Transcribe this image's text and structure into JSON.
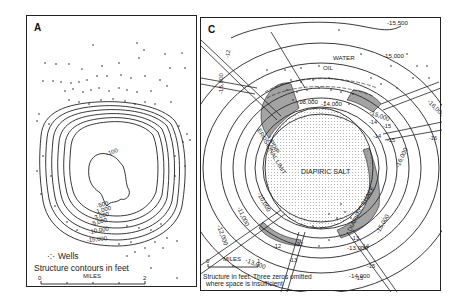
{
  "figure": {
    "panels": [
      {
        "id": "A",
        "letter": "A",
        "title": "Structure contours around salt dome (plan view)",
        "contour_labels": [
          "-100",
          "-500",
          "-1,000",
          "-3,000",
          "-5,000",
          "-10,000",
          "-15,000"
        ],
        "legend": {
          "wells_symbol": "·:·",
          "wells_label": "Wells",
          "contours_label": "Structure contours in feet"
        },
        "scale_bar": {
          "start": "0",
          "unit": "MILES",
          "end": "2"
        }
      },
      {
        "id": "C",
        "letter": "C",
        "contour_labels": {
          "outer": [
            "-15,500",
            "-15,000",
            "-16,000",
            "-16,000",
            "-15,000",
            "-14,000",
            "-13,000",
            "-12,000",
            "-11,000",
            "-10,000",
            "-15,000",
            "-14,000",
            "-13,000"
          ],
          "inner": [
            "-14,000",
            "-13,000"
          ],
          "fault_block": [
            "-14",
            "-15",
            "-14",
            "-15",
            "-16",
            "-12",
            "-12",
            "-13",
            "-13",
            "-14",
            "-15",
            "-15",
            "-12"
          ]
        },
        "fluid_labels": {
          "water": "WATER",
          "oil": "OIL"
        },
        "features": {
          "salt": "DIAPIRIC SALT",
          "shale": "DIAPIRIC SHALE",
          "updip_limit": "UPDIP",
          "erosional_limit": "EROSIONAL LIMIT"
        },
        "scale_bar": {
          "start": "0",
          "unit": "MILES",
          "end": "1"
        },
        "note_line1": "Structure in feet. Three zeros omitted",
        "note_line2": "where space is insufficient"
      }
    ]
  }
}
